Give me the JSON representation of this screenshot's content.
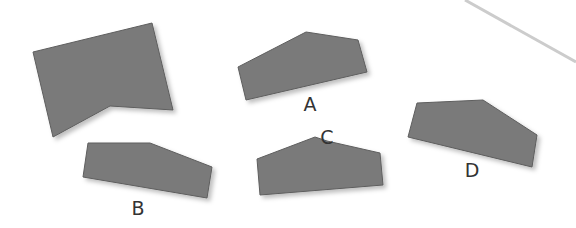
{
  "diagram": {
    "main_shape": {
      "points": "33,52 152,23 173,110 110,106 53,137"
    },
    "line": {
      "x1": 465,
      "y1": 0,
      "x2": 576,
      "y2": 62,
      "color": "#cccccc"
    },
    "options": [
      {
        "label": "A",
        "points": "238,67 306,32 358,40 367,72 246,100",
        "label_x": 310,
        "label_y": 111
      },
      {
        "label": "B",
        "points": "88,143 150,143 212,167 207,198 83,177",
        "label_x": 138,
        "label_y": 215
      },
      {
        "label": "C",
        "points": "257,159 315,137 327,141 380,153 383,185 260,195",
        "label_x": 327,
        "label_y": 144
      },
      {
        "label": "D",
        "points": "417,103 483,100 537,135 532,167 408,137",
        "label_x": 472,
        "label_y": 177
      }
    ],
    "colors": {
      "shape_fill": "#7a7a7a",
      "shape_stroke": "#5e5e5e",
      "label": "#333333"
    }
  }
}
